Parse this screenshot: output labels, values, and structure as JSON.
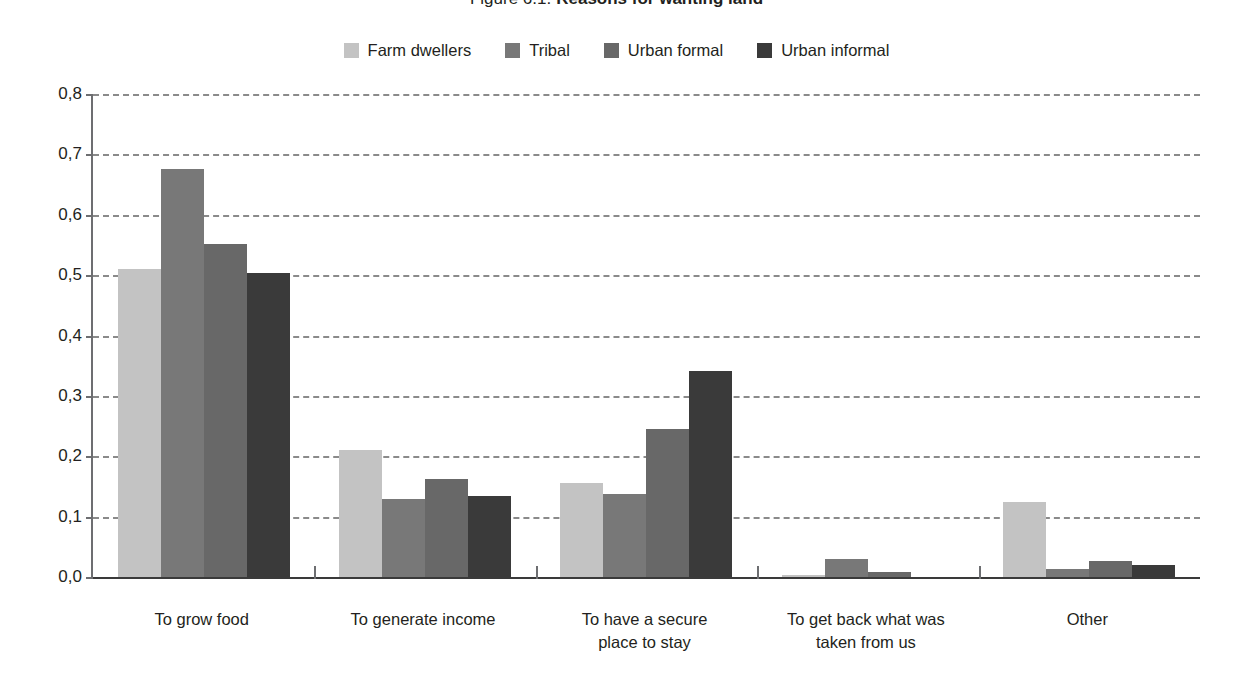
{
  "title": {
    "figure_number": "Figure 6.1:",
    "figure_name": "Reasons for wanting land"
  },
  "legend": {
    "items": [
      {
        "label": "Farm dwellers",
        "color": "#c3c3c3"
      },
      {
        "label": "Tribal",
        "color": "#787878"
      },
      {
        "label": "Urban formal",
        "color": "#686868"
      },
      {
        "label": "Urban informal",
        "color": "#3a3a3a"
      }
    ]
  },
  "axis": {
    "y_ticks": [
      "0,0",
      "0,1",
      "0,2",
      "0,3",
      "0,4",
      "0,5",
      "0,6",
      "0,7",
      "0,8"
    ],
    "y_min": 0.0,
    "y_max": 0.8,
    "x_labels": [
      "To grow food",
      "To generate income",
      "To have a secure\nplace to stay",
      "To get back what was\ntaken from us",
      "Other"
    ]
  },
  "chart_data": {
    "type": "bar",
    "xlabel": "",
    "ylabel": "",
    "ylim": [
      0.0,
      0.8
    ],
    "ytick_labels": [
      "0,0",
      "0,1",
      "0,2",
      "0,3",
      "0,4",
      "0,5",
      "0,6",
      "0,7",
      "0,8"
    ],
    "grid": true,
    "legend_position": "top-center",
    "decimal_separator": ",",
    "categories": [
      "To grow food",
      "To generate income",
      "To have a secure place to stay",
      "To get back what was taken from us",
      "Other"
    ],
    "series": [
      {
        "name": "Farm dwellers",
        "color": "#c3c3c3",
        "values": [
          0.51,
          0.21,
          0.155,
          0.004,
          0.125
        ]
      },
      {
        "name": "Tribal",
        "color": "#787878",
        "values": [
          0.676,
          0.13,
          0.138,
          0.03,
          0.013
        ]
      },
      {
        "name": "Urban formal",
        "color": "#686868",
        "values": [
          0.551,
          0.163,
          0.245,
          0.008,
          0.027
        ]
      },
      {
        "name": "Urban informal",
        "color": "#3a3a3a",
        "values": [
          0.504,
          0.135,
          0.342,
          0.0,
          0.02
        ]
      }
    ]
  }
}
